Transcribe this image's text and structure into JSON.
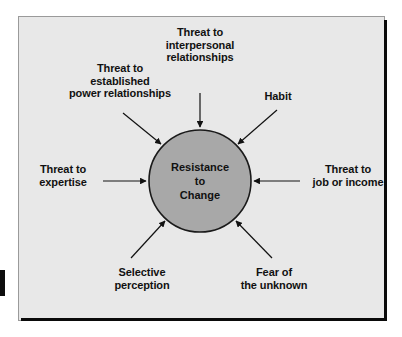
{
  "diagram": {
    "center": {
      "label": "Resistance\nto\nChange",
      "fill_color": "#a8a8a8",
      "stroke_color": "#1a1a1a"
    },
    "panel": {
      "background_color": "#e8e8e8",
      "border_color": "#9a9a9a",
      "shadow_color": "#0a0a0a"
    },
    "text_color": "#111111",
    "factors": [
      {
        "id": "interpersonal-relationships",
        "label": "Threat to\ninterpersonal\nrelationships",
        "position": "top"
      },
      {
        "id": "power-relationships",
        "label": "Threat to\nestablished\npower relationships",
        "position": "top-left"
      },
      {
        "id": "habit",
        "label": "Habit",
        "position": "top-right"
      },
      {
        "id": "expertise",
        "label": "Threat to\nexpertise",
        "position": "left"
      },
      {
        "id": "job-or-income",
        "label": "Threat to\njob or income",
        "position": "right"
      },
      {
        "id": "selective-perception",
        "label": "Selective\nperception",
        "position": "bottom-left"
      },
      {
        "id": "fear-of-unknown",
        "label": "Fear of\nthe unknown",
        "position": "bottom-right"
      }
    ]
  }
}
